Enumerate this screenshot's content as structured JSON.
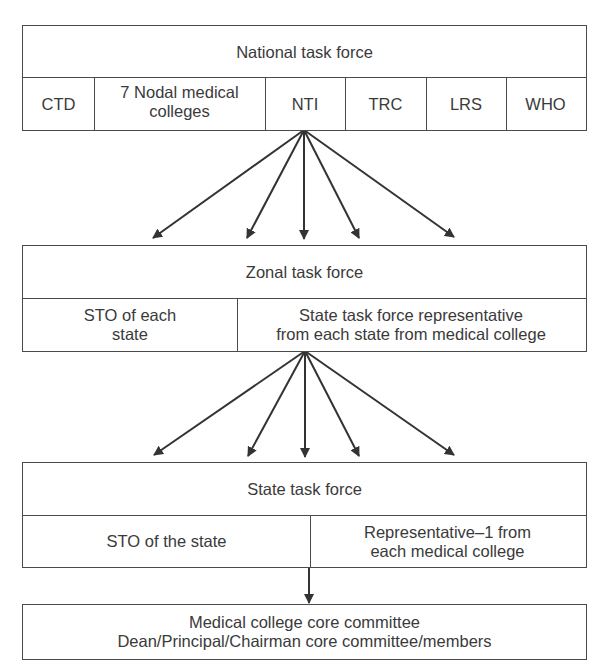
{
  "diagram": {
    "national": {
      "title": "National task force",
      "members": [
        "CTD",
        "7 Nodal medical\ncolleges",
        "NTI",
        "TRC",
        "LRS",
        "WHO"
      ]
    },
    "zonal": {
      "title": "Zonal task force",
      "members": [
        "STO of each\nstate",
        "State task force representative\nfrom each state from medical college"
      ]
    },
    "state": {
      "title": "State task force",
      "members": [
        "STO of the state",
        "Representative–1 from\neach medical college"
      ]
    },
    "core": {
      "line1": "Medical college core committee",
      "line2": "Dean/Principal/Chairman core committee/members"
    },
    "colors": {
      "line": "#4a4a4a",
      "text": "#3a3a3a",
      "arrow": "#333333"
    },
    "connections": [
      {
        "from": "National task force (NTI)",
        "to": "Zonal task force",
        "arrow_count": 5
      },
      {
        "from": "Zonal task force",
        "to": "State task force",
        "arrow_count": 5
      },
      {
        "from": "State task force",
        "to": "Medical college core committee",
        "arrow_count": 1
      }
    ]
  }
}
